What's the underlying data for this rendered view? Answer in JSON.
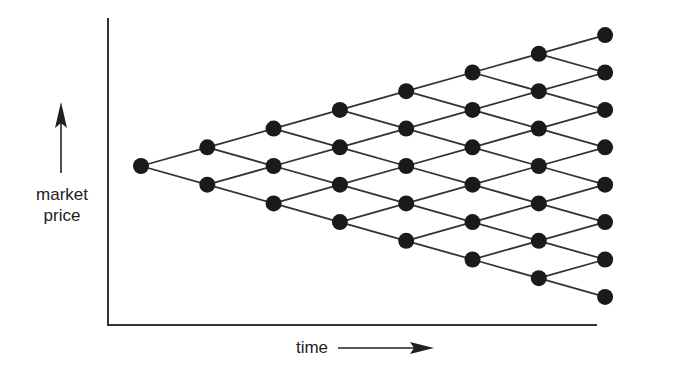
{
  "labels": {
    "y_axis_line1": "market",
    "y_axis_line2": "price",
    "x_axis": "time"
  },
  "tree": {
    "steps": 7,
    "levels": 8,
    "node_color": "#1a1a1a",
    "edge_color": "#333333",
    "origin": {
      "x": 141,
      "y": 166
    },
    "dx": 66.3,
    "dy": 18.7
  },
  "chart_data": {
    "type": "diagram",
    "title": "",
    "xlabel": "time",
    "ylabel": "market price",
    "columns": [
      1,
      2,
      3,
      4,
      5,
      6,
      7,
      8
    ]
  }
}
